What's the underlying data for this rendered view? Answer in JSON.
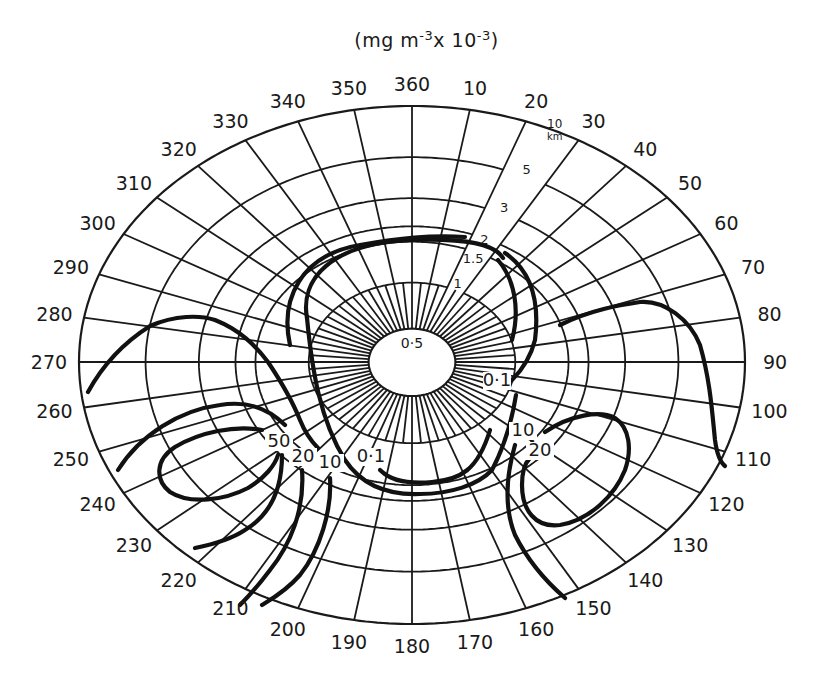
{
  "chart_data": {
    "type": "polar-contour",
    "title": "",
    "units_label": {
      "prefix": "(mg m",
      "exp1": "-3",
      "mid": "x 10",
      "exp2": "-3",
      "suffix": ")"
    },
    "azimuth_labels": [
      360,
      10,
      20,
      30,
      40,
      50,
      60,
      70,
      80,
      90,
      100,
      110,
      120,
      130,
      140,
      150,
      160,
      170,
      180,
      190,
      200,
      210,
      220,
      230,
      240,
      250,
      260,
      270,
      280,
      290,
      300,
      310,
      320,
      330,
      340,
      350
    ],
    "azimuth_step_deg": 10,
    "range_rings_km": [
      0.5,
      1,
      1.5,
      2,
      3,
      5,
      10
    ],
    "range_ring_labels": [
      "0.5",
      "1",
      "1.5",
      "2",
      "3",
      "5",
      "10"
    ],
    "range_unit": "km",
    "contour_levels": [
      0.1,
      10,
      20,
      50
    ],
    "contour_labels": [
      {
        "text": "0.5",
        "azimuth": 0,
        "range_km": 0.5
      },
      {
        "text": "0.1",
        "azimuth": 100,
        "range_km": 1
      },
      {
        "text": "0.1",
        "azimuth": 200,
        "range_km": 1.5
      },
      {
        "text": "10",
        "azimuth": 215,
        "range_km": 2
      },
      {
        "text": "20",
        "azimuth": 225,
        "range_km": 2.5
      },
      {
        "text": "50",
        "azimuth": 235,
        "range_km": 3
      },
      {
        "text": "10",
        "azimuth": 135,
        "range_km": 1.5
      },
      {
        "text": "20",
        "azimuth": 130,
        "range_km": 2
      }
    ],
    "grid": true,
    "legend": null
  },
  "figure": {
    "center": [
      412,
      362
    ],
    "outer_rx": 333,
    "outer_ry_top": 256,
    "outer_ry_bottom": 262,
    "ring_fractions": [
      0.13,
      0.31,
      0.47,
      0.53,
      0.64,
      0.8,
      1.0
    ],
    "label_gap_deg": [
      20,
      30
    ],
    "line_color": "#1a1a1a",
    "contour_color": "#111111",
    "background": "#ffffff"
  }
}
